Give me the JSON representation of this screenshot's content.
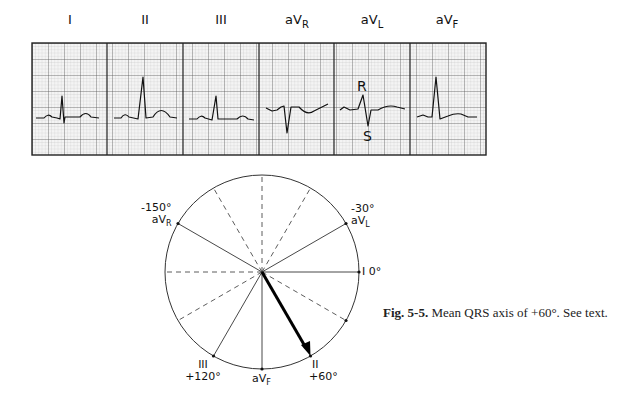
{
  "ecg_strip": {
    "leads": [
      {
        "name": "I",
        "base": "I",
        "sub": ""
      },
      {
        "name": "II",
        "base": "II",
        "sub": ""
      },
      {
        "name": "III",
        "base": "III",
        "sub": ""
      },
      {
        "name": "aVR",
        "base": "aV",
        "sub": "R"
      },
      {
        "name": "aVL",
        "base": "aV",
        "sub": "L"
      },
      {
        "name": "aVF",
        "base": "aV",
        "sub": "F"
      }
    ],
    "annotations": {
      "r_wave": "R",
      "s_wave": "S"
    }
  },
  "axis_diagram": {
    "labels": {
      "avr_deg": "-150°",
      "avr_base": "aV",
      "avr_sub": "R",
      "avl_deg": "-30°",
      "avl_base": "aV",
      "avl_sub": "L",
      "lead_i": "I",
      "lead_i_deg": "0°",
      "lead_iii": "III",
      "lead_iii_deg": "+120°",
      "avf_base": "aV",
      "avf_sub": "F",
      "lead_ii": "II",
      "lead_ii_deg": "+60°"
    },
    "mean_qrs_axis_deg": 60
  },
  "caption": {
    "fig_label": "Fig. 5-5.",
    "text": "Mean QRS axis of +60°. See text."
  }
}
